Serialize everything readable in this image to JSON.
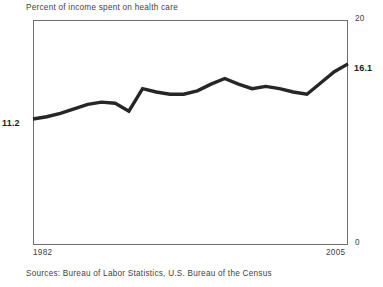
{
  "chart_data": {
    "type": "line",
    "title": "Percent of income spent on health care",
    "xlabel": "",
    "ylabel": "",
    "ylim": [
      0,
      20
    ],
    "xlim": [
      1982,
      2005
    ],
    "grid": false,
    "legend": null,
    "y_axis_position": "right",
    "y_tick_labels": [
      "20",
      "0"
    ],
    "x_tick_labels": [
      "1982",
      "2005"
    ],
    "start_value_label": "11.2",
    "end_value_label": "16.1",
    "source": "Sources: Bureau of Labor Statistics, U.S. Bureau of the Census",
    "line_color": "#262626",
    "x": [
      1982,
      1983,
      1984,
      1985,
      1986,
      1987,
      1988,
      1989,
      1990,
      1991,
      1992,
      1993,
      1994,
      1995,
      1996,
      1997,
      1998,
      1999,
      2000,
      2001,
      2002,
      2003,
      2004,
      2005
    ],
    "values": [
      11.2,
      11.4,
      11.7,
      12.1,
      12.5,
      12.7,
      12.6,
      11.9,
      13.9,
      13.6,
      13.4,
      13.4,
      13.7,
      14.3,
      14.8,
      14.3,
      13.9,
      14.1,
      13.9,
      13.6,
      13.4,
      14.4,
      15.4,
      16.1
    ],
    "series": [
      {
        "name": "Percent of income spent on health care",
        "values": [
          11.2,
          11.4,
          11.7,
          12.1,
          12.5,
          12.7,
          12.6,
          11.9,
          13.9,
          13.6,
          13.4,
          13.4,
          13.7,
          14.3,
          14.8,
          14.3,
          13.9,
          14.1,
          13.9,
          13.6,
          13.4,
          14.4,
          15.4,
          16.1
        ]
      }
    ]
  }
}
